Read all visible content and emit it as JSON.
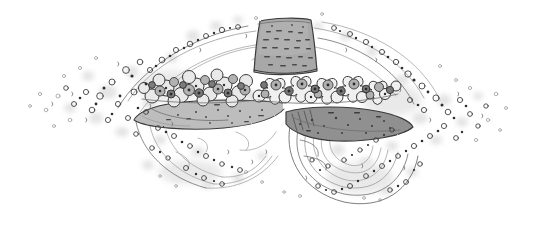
{
  "artwork": {
    "title": "Flowered sun hat sketch",
    "subject": "wide-brim hat with flower band and swirling motion lines",
    "medium": "pencil and ink line drawing",
    "width": 534,
    "height": 226,
    "background_color": "#ffffff"
  },
  "palette": {
    "background": "#ffffff",
    "ink_dark": "#3a3a3a",
    "ink_mid": "#6e6e6e",
    "ink_faint": "#9a9a9a",
    "crown_fill": "#a8a8a8",
    "crown_fill_light": "#bcbcbc",
    "brim_left_fill": "#bdbdbd",
    "brim_right_fill": "#909090",
    "flower_fill_light": "#e6e6e6",
    "flower_fill_mid": "#b5b5b5",
    "flower_fill_dark": "#7d7d7d",
    "smudge_gray": "#cfcfcf",
    "speck_dark": "#4a4a4a"
  },
  "elements": {
    "crown": {
      "name": "hat crown",
      "shape": "tapered trapezoid, narrower at top",
      "bounds": {
        "x": 253,
        "y": 17,
        "w": 64,
        "h": 56
      },
      "fill": "#a8a8a8",
      "texture": "short horizontal dash marks in rows"
    },
    "brim_left": {
      "name": "left hat brim",
      "shape": "long tapering sweep to the left",
      "bounds": {
        "x": 133,
        "y": 100,
        "w": 150,
        "h": 30
      },
      "fill": "#bdbdbd",
      "texture": "sparse dots and dashes"
    },
    "brim_right": {
      "name": "right hat brim",
      "shape": "pointed lens / leaf form to the right",
      "bounds": {
        "x": 283,
        "y": 108,
        "w": 130,
        "h": 32
      },
      "fill": "#909090",
      "texture": "scattered dark dots, hatch lines at left tip"
    },
    "flower_band": {
      "name": "flower garland band",
      "shape": "dense cluster of rounded blossoms around the crown base",
      "bounds": {
        "x": 140,
        "y": 55,
        "w": 260,
        "h": 52
      },
      "blossom_count": 46
    },
    "swirls": {
      "name": "swirling motion arcs",
      "description": "thin arcs sweeping outward left and right, and nested concentric arcs forming a vortex under the right brim",
      "arc_count": 22
    },
    "speckle_field": {
      "name": "scattered dot texture",
      "description": "small circular doodles with soft gray smudges, dense near the hat and thinning toward both edges",
      "extent": {
        "x_min": 26,
        "x_max": 512,
        "y_min": 14,
        "y_max": 206
      },
      "dot_count": 210
    }
  }
}
